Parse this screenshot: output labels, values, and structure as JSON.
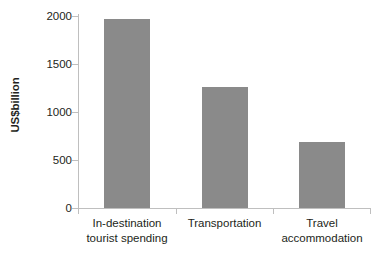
{
  "chart_data": {
    "type": "bar",
    "title": "",
    "subtitle": "",
    "xlabel": "",
    "ylabel": "US$billion",
    "categories": [
      "In-destination tourist spending",
      "Transportation",
      "Travel accommodation"
    ],
    "category_lines": [
      [
        "In-destination",
        "tourist spending"
      ],
      [
        "Transportation",
        ""
      ],
      [
        "Travel",
        "accommodation"
      ]
    ],
    "values": [
      1950,
      1250,
      680
    ],
    "ylim": [
      0,
      2000
    ],
    "yticks": [
      0,
      500,
      1000,
      1500,
      2000
    ],
    "ytick_labels": [
      "0",
      "500",
      "1000",
      "1500",
      "2000"
    ],
    "grid": false,
    "legend": null,
    "bar_color": "#8a8a8a",
    "axis_color": "#bfbfbf",
    "text_color": "#231f20"
  }
}
